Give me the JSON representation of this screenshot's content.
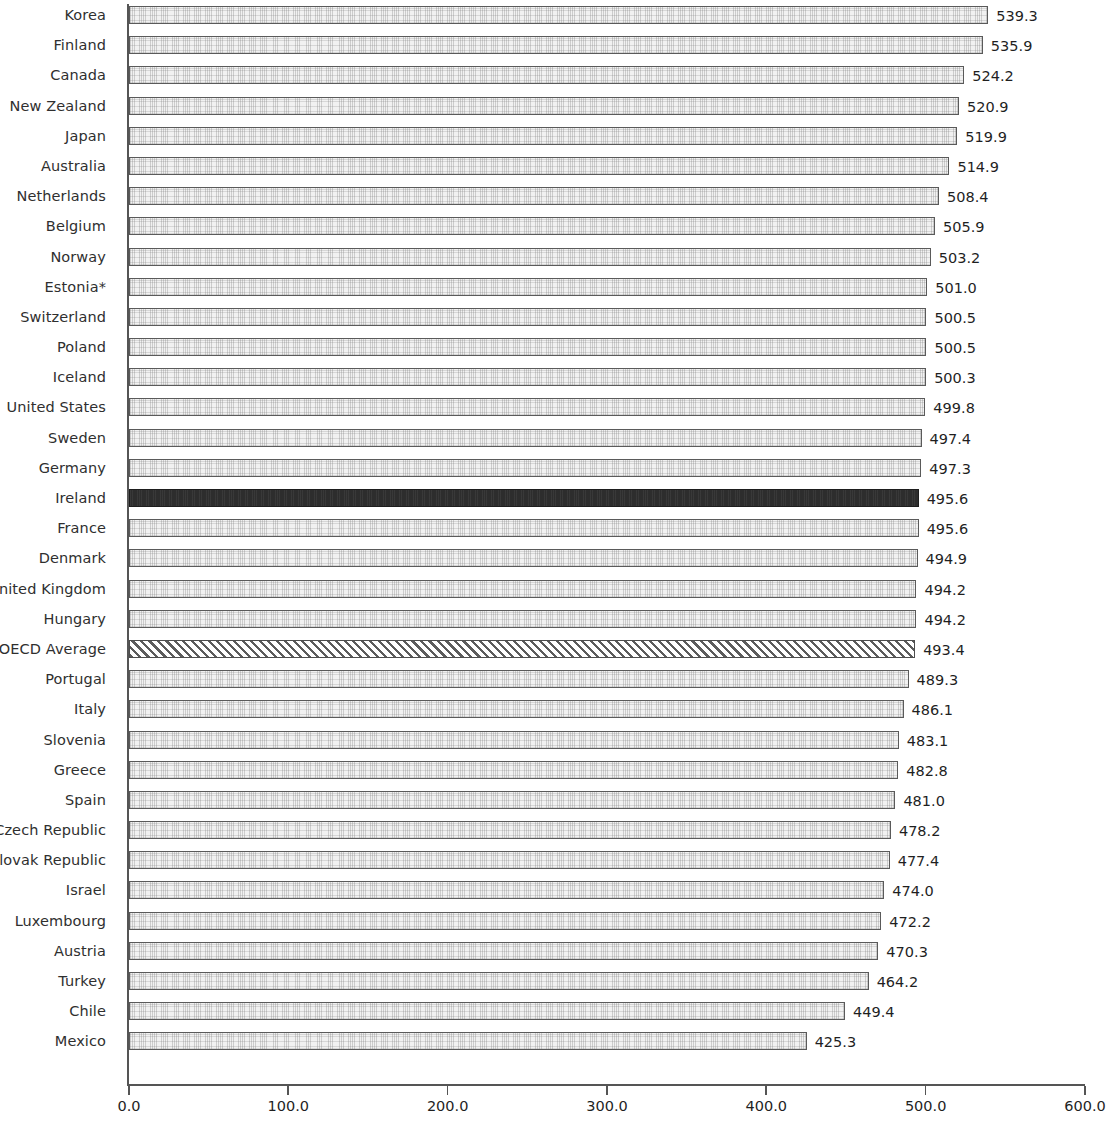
{
  "chart_data": {
    "type": "bar",
    "orientation": "horizontal",
    "title": "",
    "subtitle": "",
    "xlabel": "",
    "ylabel": "",
    "xlim": [
      0.0,
      600.0
    ],
    "xticks": [
      "0.0",
      "100.0",
      "200.0",
      "300.0",
      "400.0",
      "500.0",
      "600.0"
    ],
    "xtick_values": [
      0,
      100,
      200,
      300,
      400,
      500,
      600
    ],
    "grid": false,
    "legend": "none",
    "categories": [
      "Korea",
      "Finland",
      "Canada",
      "New Zealand",
      "Japan",
      "Australia",
      "Netherlands",
      "Belgium",
      "Norway",
      "Estonia*",
      "Switzerland",
      "Poland",
      "Iceland",
      "United States",
      "Sweden",
      "Germany",
      "Ireland",
      "France",
      "Denmark",
      "United Kingdom",
      "Hungary",
      "OECD Average",
      "Portugal",
      "Italy",
      "Slovenia",
      "Greece",
      "Spain",
      "Czech Republic",
      "Slovak Republic",
      "Israel",
      "Luxembourg",
      "Austria",
      "Turkey",
      "Chile",
      "Mexico"
    ],
    "values": [
      539.3,
      535.9,
      524.2,
      520.9,
      519.9,
      514.9,
      508.4,
      505.9,
      503.2,
      501.0,
      500.5,
      500.5,
      500.3,
      499.8,
      497.4,
      497.3,
      495.6,
      495.6,
      494.9,
      494.2,
      494.2,
      493.4,
      489.3,
      486.1,
      483.1,
      482.8,
      481.0,
      478.2,
      477.4,
      474.0,
      472.2,
      470.3,
      464.2,
      449.4,
      425.3
    ],
    "value_labels": [
      "539.3",
      "535.9",
      "524.2",
      "520.9",
      "519.9",
      "514.9",
      "508.4",
      "505.9",
      "503.2",
      "501.0",
      "500.5",
      "500.5",
      "500.3",
      "499.8",
      "497.4",
      "497.3",
      "495.6",
      "495.6",
      "494.9",
      "494.2",
      "494.2",
      "493.4",
      "489.3",
      "486.1",
      "483.1",
      "482.8",
      "481.0",
      "478.2",
      "477.4",
      "474.0",
      "472.2",
      "470.3",
      "464.2",
      "449.4",
      "425.3"
    ],
    "bar_styles": [
      "stipple",
      "stipple",
      "stipple",
      "stipple",
      "stipple",
      "stipple",
      "stipple",
      "stipple",
      "stipple",
      "stipple",
      "stipple",
      "stipple",
      "stipple",
      "stipple",
      "stipple",
      "stipple",
      "highlight",
      "stipple",
      "stipple",
      "stipple",
      "stipple",
      "hatched",
      "stipple",
      "stipple",
      "stipple",
      "stipple",
      "stipple",
      "stipple",
      "stipple",
      "stipple",
      "stipple",
      "stipple",
      "stipple",
      "stipple",
      "stipple"
    ],
    "colors": {
      "bar_fill": "#f1f1f1",
      "bar_border": "#5a5a5a",
      "highlight_fill": "#2d2d2d",
      "hatch_stroke": "#5c5c5c",
      "axis": "#555555",
      "label_text": "#2f2f2f",
      "value_text": "#1f1f1f",
      "background": "#ffffff"
    }
  }
}
